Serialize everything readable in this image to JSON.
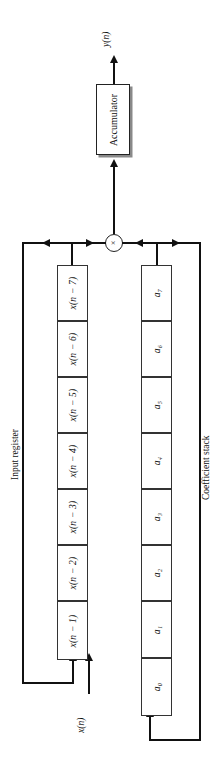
{
  "diagram": {
    "orientation": "rotated-90-ccw",
    "output_label": "y(n)",
    "input_label": "x(n)",
    "accumulator_label": "Accumulator",
    "multiplier_glyph": "×",
    "input_register_label": "Input register",
    "coefficient_stack_label": "Coefficient stack",
    "input_register_cells": [
      "x(n − 1)",
      "x(n − 2)",
      "x(n − 3)",
      "x(n − 4)",
      "x(n − 5)",
      "x(n − 6)",
      "x(n − 7)"
    ],
    "coefficient_cells": [
      "a₀",
      "a₁",
      "a₂",
      "a₃",
      "a₄",
      "a₅",
      "a₆",
      "a₇"
    ],
    "colors": {
      "stroke": "#111111",
      "box_border": "#333333",
      "background": "#ffffff"
    }
  }
}
